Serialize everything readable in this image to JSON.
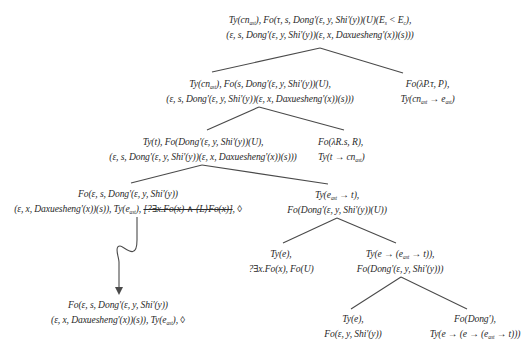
{
  "diagram": {
    "type": "derivation-tree",
    "nodes": [
      {
        "id": "root",
        "lines": [
          "Ty(cn_ast), Fo(τ, s, Dong'(ε, y, Shi'(y))(U)(E_s < E_c),",
          "(ε, s, Dong'(ε, y, Shi'(y))(ε, x, Daxuesheng'(x))(s)))"
        ]
      },
      {
        "id": "n1-left",
        "lines": [
          "Ty(cn_ast), Fo(s, Dong'(ε, y, Shi'(y))(U),",
          "(ε, s, Dong'(ε, y, Shi'(y))(ε, x, Daxuesheng'(x))(s)))"
        ]
      },
      {
        "id": "n1-right",
        "lines": [
          "Fo(λP.τ, P),",
          "Ty(cn_ast → e_ast)"
        ]
      },
      {
        "id": "n2-left",
        "lines": [
          "Ty(t), Fo(Dong'(ε, y, Shi'(y))(U),",
          "(ε, s, Dong'(ε, y, Shi'(y))(ε, x, Daxuesheng'(x))(s)))"
        ]
      },
      {
        "id": "n2-right",
        "lines": [
          "Fo(λR.s, R),",
          "Ty(t → cn_ast)"
        ]
      },
      {
        "id": "n3-left",
        "lines": [
          "Fo(ε, s, Dong'(ε, y, Shi'(y))",
          "(ε, x, Daxuesheng'(x))(s)), Ty(e_ast), [?∃x.Fo(x) ∧ ⟨L⟩Fo(x)], ◊"
        ],
        "struck_text": "?∃x.Fo(x) ∧ ⟨L⟩Fo(x)"
      },
      {
        "id": "n3-right",
        "lines": [
          "Ty(e_ast → t),",
          "Fo(Dong'(ε, y, Shi'(y))(U))"
        ]
      },
      {
        "id": "n4-left",
        "lines": [
          "Ty(e),",
          "?∃x.Fo(x), Fo(U)"
        ]
      },
      {
        "id": "n4-right",
        "lines": [
          "Ty(e → (e_ast → t)),",
          "Fo(Dong'(ε, y, Shi'(y)))"
        ]
      },
      {
        "id": "n5-left",
        "lines": [
          "Ty(e),",
          "Fo(ε, y, Shi'(y))"
        ]
      },
      {
        "id": "n5-right",
        "lines": [
          "Fo(Dong'),",
          "Ty(e → (e → (e_ast → t)))"
        ]
      },
      {
        "id": "result",
        "lines": [
          "Fo(ε, s, Dong'(ε, y, Shi'(y))",
          "(ε, x, Daxuesheng'(x))(s)), Ty(e_ast), ◊"
        ]
      }
    ],
    "edges": [
      [
        "root",
        "n1-left"
      ],
      [
        "root",
        "n1-right"
      ],
      [
        "n1-left",
        "n2-left"
      ],
      [
        "n1-left",
        "n2-right"
      ],
      [
        "n2-left",
        "n3-left"
      ],
      [
        "n2-left",
        "n3-right"
      ],
      [
        "n3-right",
        "n4-left"
      ],
      [
        "n3-right",
        "n4-right"
      ],
      [
        "n4-right",
        "n5-left"
      ],
      [
        "n4-right",
        "n5-right"
      ]
    ],
    "transition_arrow": {
      "from": "n3-left",
      "to": "result",
      "style": "wavy-down-arrow"
    }
  }
}
